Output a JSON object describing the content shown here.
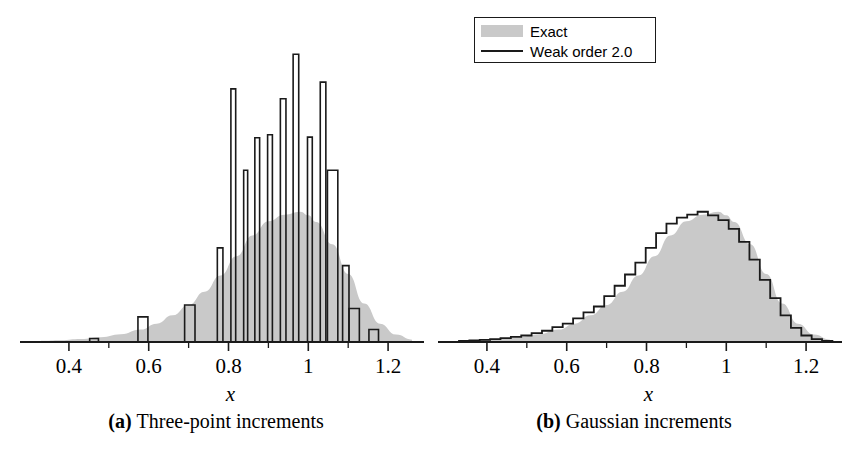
{
  "legend": {
    "entries": [
      {
        "label": "Exact",
        "style": "filled-patch",
        "color": "#c9c9c9"
      },
      {
        "label": "Weak order 2.0",
        "style": "line",
        "color": "#1a1a1a"
      }
    ]
  },
  "panels": [
    {
      "id": "a",
      "caption_tag": "(a)",
      "caption_text": "Three-point increments",
      "axis": {
        "xlabel": "x",
        "xticks": [
          0.4,
          0.6,
          0.8,
          1.0,
          1.2
        ],
        "xticklabels": [
          "0.4",
          "0.6",
          "0.8",
          "1",
          "1.2"
        ],
        "xminorticks": [
          0.5,
          0.7,
          0.9,
          1.1
        ],
        "xlim": [
          0.33,
          1.28
        ],
        "ylim": [
          0,
          1.0
        ]
      }
    },
    {
      "id": "b",
      "caption_tag": "(b)",
      "caption_text": "Gaussian increments",
      "axis": {
        "xlabel": "x",
        "xticks": [
          0.4,
          0.6,
          0.8,
          1.0,
          1.2
        ],
        "xticklabels": [
          "0.4",
          "0.6",
          "0.8",
          "1",
          "1.2"
        ],
        "xminorticks": [
          0.5,
          0.7,
          0.9,
          1.1
        ],
        "xlim": [
          0.33,
          1.28
        ],
        "ylim": [
          0,
          1.0
        ]
      }
    }
  ],
  "chart_data": [
    {
      "type": "bar",
      "panel": "a",
      "title": "Three-point increments",
      "xlabel": "x",
      "ylabel": "",
      "xlim": [
        0.33,
        1.28
      ],
      "ylim": [
        0,
        1.0
      ],
      "grid": false,
      "legend_position": "above-right",
      "series": [
        {
          "name": "Exact",
          "kind": "filled-density",
          "color": "#c9c9c9",
          "x": [
            0.33,
            0.38,
            0.43,
            0.48,
            0.53,
            0.58,
            0.62,
            0.66,
            0.7,
            0.74,
            0.78,
            0.82,
            0.86,
            0.9,
            0.94,
            0.98,
            1.0,
            1.02,
            1.06,
            1.1,
            1.14,
            1.18,
            1.22,
            1.26
          ],
          "y": [
            0.004,
            0.006,
            0.01,
            0.016,
            0.026,
            0.042,
            0.062,
            0.09,
            0.125,
            0.17,
            0.225,
            0.29,
            0.36,
            0.408,
            0.43,
            0.44,
            0.428,
            0.405,
            0.33,
            0.23,
            0.13,
            0.062,
            0.025,
            0.008
          ]
        },
        {
          "name": "Weak order 2.0",
          "kind": "histogram-spikes",
          "color": "#1a1a1a",
          "bins": [
            {
              "left": 0.452,
              "right": 0.474,
              "height": 0.012
            },
            {
              "left": 0.573,
              "right": 0.598,
              "height": 0.085
            },
            {
              "left": 0.69,
              "right": 0.716,
              "height": 0.125
            },
            {
              "left": 0.772,
              "right": 0.786,
              "height": 0.318
            },
            {
              "left": 0.806,
              "right": 0.818,
              "height": 0.855
            },
            {
              "left": 0.838,
              "right": 0.848,
              "height": 0.58
            },
            {
              "left": 0.866,
              "right": 0.878,
              "height": 0.69
            },
            {
              "left": 0.898,
              "right": 0.91,
              "height": 0.7
            },
            {
              "left": 0.93,
              "right": 0.944,
              "height": 0.822
            },
            {
              "left": 0.962,
              "right": 0.976,
              "height": 0.972
            },
            {
              "left": 0.998,
              "right": 1.01,
              "height": 0.692
            },
            {
              "left": 1.03,
              "right": 1.044,
              "height": 0.878
            },
            {
              "left": 1.048,
              "right": 1.074,
              "height": 0.58
            },
            {
              "left": 1.086,
              "right": 1.102,
              "height": 0.258
            },
            {
              "left": 1.102,
              "right": 1.128,
              "height": 0.113
            },
            {
              "left": 1.152,
              "right": 1.176,
              "height": 0.042
            }
          ]
        }
      ]
    },
    {
      "type": "bar",
      "panel": "b",
      "title": "Gaussian increments",
      "xlabel": "x",
      "ylabel": "",
      "xlim": [
        0.33,
        1.28
      ],
      "ylim": [
        0,
        1.0
      ],
      "grid": false,
      "legend_position": "above-right",
      "series": [
        {
          "name": "Exact",
          "kind": "filled-density",
          "color": "#c9c9c9",
          "x": [
            0.33,
            0.38,
            0.43,
            0.48,
            0.53,
            0.58,
            0.62,
            0.66,
            0.7,
            0.74,
            0.78,
            0.82,
            0.86,
            0.9,
            0.94,
            0.98,
            1.0,
            1.02,
            1.06,
            1.1,
            1.14,
            1.18,
            1.22,
            1.26
          ],
          "y": [
            0.004,
            0.006,
            0.01,
            0.016,
            0.026,
            0.042,
            0.062,
            0.09,
            0.125,
            0.17,
            0.225,
            0.29,
            0.36,
            0.408,
            0.43,
            0.44,
            0.428,
            0.405,
            0.33,
            0.23,
            0.13,
            0.062,
            0.025,
            0.008
          ]
        },
        {
          "name": "Weak order 2.0",
          "kind": "histogram-steps",
          "color": "#1a1a1a",
          "bin_width": 0.026,
          "bins": [
            {
              "left": 0.33,
              "right": 0.356,
              "height": 0.004
            },
            {
              "left": 0.356,
              "right": 0.382,
              "height": 0.005
            },
            {
              "left": 0.382,
              "right": 0.408,
              "height": 0.007
            },
            {
              "left": 0.408,
              "right": 0.434,
              "height": 0.01
            },
            {
              "left": 0.434,
              "right": 0.46,
              "height": 0.013
            },
            {
              "left": 0.46,
              "right": 0.486,
              "height": 0.017
            },
            {
              "left": 0.486,
              "right": 0.512,
              "height": 0.022
            },
            {
              "left": 0.512,
              "right": 0.538,
              "height": 0.03
            },
            {
              "left": 0.538,
              "right": 0.564,
              "height": 0.038
            },
            {
              "left": 0.564,
              "right": 0.59,
              "height": 0.05
            },
            {
              "left": 0.59,
              "right": 0.616,
              "height": 0.062
            },
            {
              "left": 0.616,
              "right": 0.642,
              "height": 0.08
            },
            {
              "left": 0.642,
              "right": 0.668,
              "height": 0.1
            },
            {
              "left": 0.668,
              "right": 0.694,
              "height": 0.12
            },
            {
              "left": 0.694,
              "right": 0.72,
              "height": 0.155
            },
            {
              "left": 0.72,
              "right": 0.746,
              "height": 0.19
            },
            {
              "left": 0.746,
              "right": 0.772,
              "height": 0.228
            },
            {
              "left": 0.772,
              "right": 0.798,
              "height": 0.268
            },
            {
              "left": 0.798,
              "right": 0.824,
              "height": 0.318
            },
            {
              "left": 0.824,
              "right": 0.85,
              "height": 0.368
            },
            {
              "left": 0.85,
              "right": 0.876,
              "height": 0.4
            },
            {
              "left": 0.876,
              "right": 0.902,
              "height": 0.42
            },
            {
              "left": 0.902,
              "right": 0.928,
              "height": 0.43
            },
            {
              "left": 0.928,
              "right": 0.954,
              "height": 0.44
            },
            {
              "left": 0.954,
              "right": 0.98,
              "height": 0.428
            },
            {
              "left": 0.98,
              "right": 1.006,
              "height": 0.412
            },
            {
              "left": 1.006,
              "right": 1.032,
              "height": 0.382
            },
            {
              "left": 1.032,
              "right": 1.058,
              "height": 0.338
            },
            {
              "left": 1.058,
              "right": 1.084,
              "height": 0.278
            },
            {
              "left": 1.084,
              "right": 1.11,
              "height": 0.21
            },
            {
              "left": 1.11,
              "right": 1.136,
              "height": 0.148
            },
            {
              "left": 1.136,
              "right": 1.162,
              "height": 0.09
            },
            {
              "left": 1.162,
              "right": 1.188,
              "height": 0.048
            },
            {
              "left": 1.188,
              "right": 1.214,
              "height": 0.022
            },
            {
              "left": 1.214,
              "right": 1.24,
              "height": 0.01
            },
            {
              "left": 1.24,
              "right": 1.266,
              "height": 0.004
            }
          ]
        }
      ]
    }
  ]
}
